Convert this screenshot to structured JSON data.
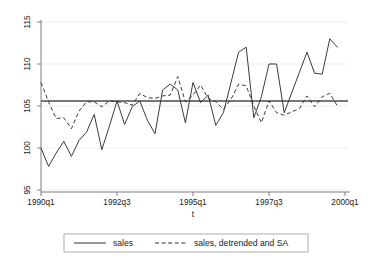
{
  "chart_data": {
    "type": "line",
    "title": "",
    "xlabel": "t",
    "ylabel": "",
    "ylim": [
      95,
      115
    ],
    "yticks": [
      95,
      100,
      105,
      110,
      115
    ],
    "ytick_labels": [
      "95",
      "100",
      "105",
      "110",
      "115"
    ],
    "xlim_labels": [
      "1990q1",
      "2000q1"
    ],
    "xticks": [
      "1990q1",
      "1992q3",
      "1995q1",
      "1997q3",
      "2000q1"
    ],
    "xtick_positions": [
      0,
      10,
      20,
      30,
      40
    ],
    "grid": true,
    "legend_position": "below",
    "reference_line": 105.6,
    "x": [
      "1990q1",
      "1990q2",
      "1990q3",
      "1990q4",
      "1991q1",
      "1991q2",
      "1991q3",
      "1991q4",
      "1992q1",
      "1992q2",
      "1992q3",
      "1992q4",
      "1993q1",
      "1993q2",
      "1993q3",
      "1993q4",
      "1994q1",
      "1994q2",
      "1994q3",
      "1994q4",
      "1995q1",
      "1995q2",
      "1995q3",
      "1995q4",
      "1996q1",
      "1996q2",
      "1996q3",
      "1996q4",
      "1997q1",
      "1997q2",
      "1997q3",
      "1997q4",
      "1998q1",
      "1998q2",
      "1998q3",
      "1998q4",
      "1999q1",
      "1999q2",
      "1999q3",
      "1999q4"
    ],
    "series": [
      {
        "name": "sales",
        "style": "solid",
        "values": [
          100.0,
          97.8,
          99.4,
          100.8,
          99.0,
          100.9,
          101.9,
          104.0,
          99.8,
          102.6,
          105.6,
          102.8,
          104.9,
          105.6,
          103.3,
          101.7,
          106.9,
          107.6,
          106.9,
          103.0,
          107.8,
          105.4,
          106.3,
          102.7,
          104.2,
          107.8,
          111.4,
          112.0,
          103.6,
          106.1,
          110.0,
          110.0,
          104.2,
          106.6,
          109.0,
          111.4,
          108.9,
          108.8,
          113.0,
          112.0
        ]
      },
      {
        "name": "sales, detrended and SA",
        "style": "dashed",
        "values": [
          107.8,
          105.5,
          103.5,
          103.6,
          102.3,
          104.4,
          105.5,
          105.5,
          104.9,
          105.6,
          105.5,
          105.4,
          105.1,
          106.5,
          106.0,
          105.9,
          106.2,
          106.3,
          108.5,
          105.5,
          106.3,
          107.5,
          105.9,
          105.5,
          104.6,
          105.8,
          107.6,
          107.4,
          105.0,
          103.0,
          105.6,
          104.2,
          103.9,
          104.3,
          104.7,
          106.2,
          104.9,
          106.1,
          106.5,
          105.0
        ]
      }
    ]
  },
  "legend": {
    "entries": [
      {
        "label": "sales",
        "style": "solid"
      },
      {
        "label": "sales, detrended and SA",
        "style": "dashed"
      }
    ]
  },
  "axis": {
    "x_title": "t",
    "y_ticks": [
      "115",
      "110",
      "105",
      "100",
      "95"
    ],
    "x_ticks": [
      "1990q1",
      "1992q3",
      "1995q1",
      "1997q3",
      "2000q1"
    ]
  }
}
